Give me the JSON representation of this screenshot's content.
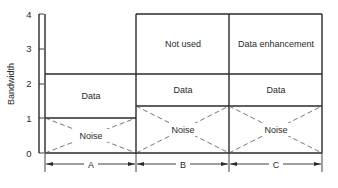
{
  "diagram": {
    "y_axis": {
      "label": "Bandwidth",
      "ticks": [
        "0",
        "1",
        "2",
        "3",
        "4"
      ]
    },
    "columns": [
      {
        "id": "A",
        "label": "A",
        "blocks": [
          {
            "label": "Noise",
            "from": 0,
            "to": 1,
            "style": "crossed-dashed"
          },
          {
            "label": "Data",
            "from": 1,
            "to": 2.25
          }
        ]
      },
      {
        "id": "B",
        "label": "B",
        "blocks": [
          {
            "label": "Noise",
            "from": 0,
            "to": 1.35,
            "style": "crossed-dashed"
          },
          {
            "label": "Data",
            "from": 1.35,
            "to": 2.25
          },
          {
            "label": "Not used",
            "from": 2.25,
            "to": 4
          }
        ]
      },
      {
        "id": "C",
        "label": "C",
        "blocks": [
          {
            "label": "Noise",
            "from": 0,
            "to": 1.35,
            "style": "crossed-dashed"
          },
          {
            "label": "Data",
            "from": 1.35,
            "to": 2.25
          },
          {
            "label": "Data enhancement",
            "from": 2.25,
            "to": 4
          }
        ]
      }
    ],
    "colors": {
      "line": "#2a2a2a",
      "background": "#ffffff"
    }
  }
}
